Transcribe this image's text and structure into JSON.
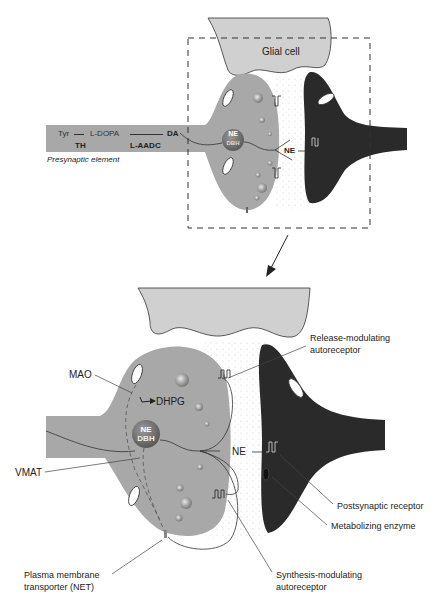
{
  "colors": {
    "presynaptic": "#a8a8a8",
    "postsynaptic": "#2a2a2a",
    "glial": "#d0d0d0",
    "vesicle": "#bdbdbd",
    "outline": "#333333",
    "background": "#ffffff"
  },
  "top_panel": {
    "glial_label": "Glial cell",
    "pathway": {
      "tyr": "Tyr",
      "ldopa": "L-DOPA",
      "da": "DA",
      "th": "TH",
      "laadc": "L-AADC"
    },
    "presynaptic_label": "Presynaptic element",
    "vesicle_ne": "NE",
    "vesicle_dbh": "DBH",
    "released_ne": "NE"
  },
  "bottom_panel": {
    "vesicle_ne": "NE",
    "vesicle_dbh": "DBH",
    "released_ne": "NE",
    "dhpg": "DHPG",
    "labels": {
      "mao": "MAO",
      "vmat": "VMAT",
      "net_line1": "Plasma membrane",
      "net_line2": "transporter (NET)",
      "release_line1": "Release-modulating",
      "release_line2": "autoreceptor",
      "postsynaptic": "Postsynaptic receptor",
      "metabolizing": "Metabolizing enzyme",
      "synthesis_line1": "Synthesis-modulating",
      "synthesis_line2": "autoreceptor"
    }
  }
}
